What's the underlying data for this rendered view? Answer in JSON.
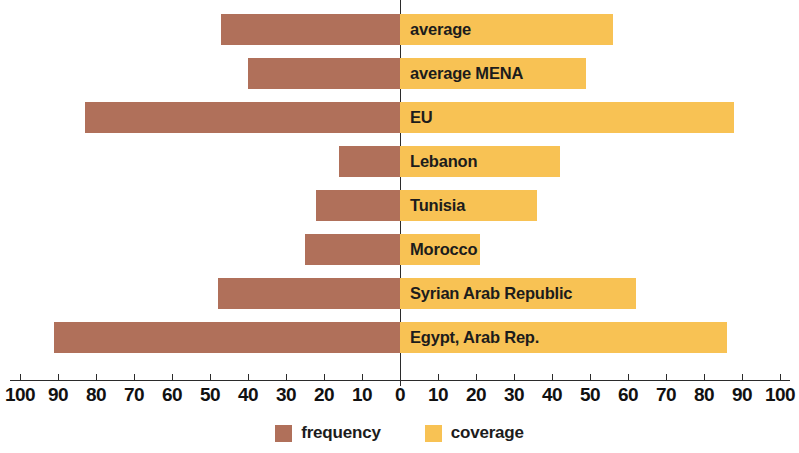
{
  "chart_data": {
    "type": "bar",
    "orientation": "horizontal-diverging",
    "title": "",
    "subtitle": "",
    "xlabel": "",
    "ylabel": "",
    "grid": false,
    "legend_position": "bottom-center",
    "axis": {
      "center_value": 0,
      "left_max": 100,
      "right_max": 100,
      "tick_step": 10,
      "tick_labels_left": [
        "100",
        "90",
        "80",
        "70",
        "60",
        "50",
        "40",
        "30",
        "20",
        "10"
      ],
      "tick_label_center": "0",
      "tick_labels_right": [
        "10",
        "20",
        "30",
        "40",
        "50",
        "60",
        "70",
        "80",
        "90",
        "100"
      ],
      "all_tick_labels": [
        "100",
        "90",
        "80",
        "70",
        "60",
        "50",
        "40",
        "30",
        "20",
        "10",
        "0",
        "10",
        "20",
        "30",
        "40",
        "50",
        "60",
        "70",
        "80",
        "90",
        "100"
      ]
    },
    "categories": [
      "average",
      "average MENA",
      "EU",
      "Lebanon",
      "Tunisia",
      "Morocco",
      "Syrian Arab Republic",
      "Egypt, Arab Rep."
    ],
    "series": [
      {
        "name": "frequency",
        "side": "left",
        "color": "#b0705a",
        "values": [
          47,
          40,
          83,
          16,
          22,
          25,
          48,
          91
        ]
      },
      {
        "name": "coverage",
        "side": "right",
        "color": "#f8c254",
        "values": [
          56,
          49,
          88,
          42,
          36,
          21,
          62,
          86
        ]
      }
    ],
    "rows": [
      {
        "label": "average",
        "frequency": 47,
        "coverage": 56
      },
      {
        "label": "average MENA",
        "frequency": 40,
        "coverage": 49
      },
      {
        "label": "EU",
        "frequency": 83,
        "coverage": 88
      },
      {
        "label": "Lebanon",
        "frequency": 16,
        "coverage": 42
      },
      {
        "label": "Tunisia",
        "frequency": 22,
        "coverage": 36
      },
      {
        "label": "Morocco",
        "frequency": 25,
        "coverage": 21
      },
      {
        "label": "Syrian Arab Republic",
        "frequency": 48,
        "coverage": 62
      },
      {
        "label": "Egypt, Arab Rep.",
        "frequency": 91,
        "coverage": 86
      }
    ]
  },
  "legend": {
    "items": [
      {
        "label": "frequency",
        "color": "#b0705a"
      },
      {
        "label": "coverage",
        "color": "#f8c254"
      }
    ]
  },
  "colors": {
    "frequency": "#b0705a",
    "coverage": "#f8c254",
    "axis": "#2b2b2b",
    "text": "#1c1c1c",
    "background": "#ffffff"
  }
}
